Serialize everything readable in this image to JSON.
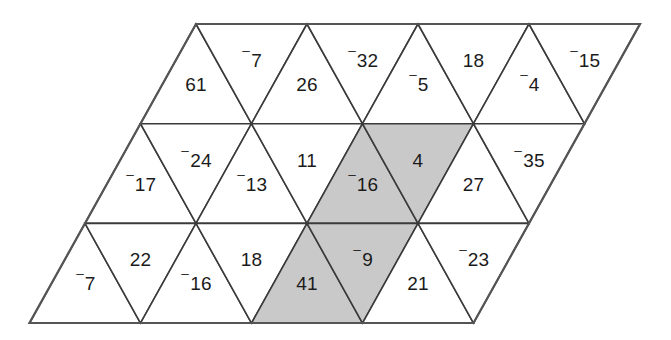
{
  "figure": {
    "name": "triangular-number-grid",
    "shape": "rhombus",
    "rows": 3,
    "cells_per_row": 9,
    "colors": {
      "background": "#ffffff",
      "cell_fill": "#ffffff",
      "shaded_fill": "#c9c9c9",
      "stroke": "#3a3a3a",
      "text": "#1b1b1b"
    },
    "negative_sign": "⁻"
  },
  "geometry": {
    "top_left_x": 196,
    "top_y": 24,
    "bottom_y": 323,
    "row_height": 99.7,
    "half_width": 55.5,
    "row_shift": -55.5
  },
  "chart_data": {
    "type": "table",
    "title": "",
    "rows": [
      {
        "row": 1,
        "cells": [
          {
            "index": 0,
            "orientation": "up",
            "value": "61",
            "sign": "",
            "magnitude": 61,
            "shaded": false
          },
          {
            "index": 1,
            "orientation": "down",
            "value": "⁻7",
            "sign": "⁻",
            "magnitude": 7,
            "shaded": false
          },
          {
            "index": 2,
            "orientation": "up",
            "value": "26",
            "sign": "",
            "magnitude": 26,
            "shaded": false
          },
          {
            "index": 3,
            "orientation": "down",
            "value": "⁻32",
            "sign": "⁻",
            "magnitude": 32,
            "shaded": false
          },
          {
            "index": 4,
            "orientation": "up",
            "value": "⁻5",
            "sign": "⁻",
            "magnitude": 5,
            "shaded": false
          },
          {
            "index": 5,
            "orientation": "down",
            "value": "18",
            "sign": "",
            "magnitude": 18,
            "shaded": false
          },
          {
            "index": 6,
            "orientation": "up",
            "value": "⁻4",
            "sign": "⁻",
            "magnitude": 4,
            "shaded": false
          },
          {
            "index": 7,
            "orientation": "down",
            "value": "⁻15",
            "sign": "⁻",
            "magnitude": 15,
            "shaded": false
          },
          {
            "index": 8,
            "orientation": "up",
            "value": "",
            "sign": "",
            "magnitude": null,
            "shaded": false
          }
        ]
      },
      {
        "row": 2,
        "cells": [
          {
            "index": 0,
            "orientation": "up",
            "value": "⁻17",
            "sign": "⁻",
            "magnitude": 17,
            "shaded": false
          },
          {
            "index": 1,
            "orientation": "down",
            "value": "⁻24",
            "sign": "⁻",
            "magnitude": 24,
            "shaded": false
          },
          {
            "index": 2,
            "orientation": "up",
            "value": "⁻13",
            "sign": "⁻",
            "magnitude": 13,
            "shaded": false
          },
          {
            "index": 3,
            "orientation": "down",
            "value": "11",
            "sign": "",
            "magnitude": 11,
            "shaded": false
          },
          {
            "index": 4,
            "orientation": "up",
            "value": "⁻16",
            "sign": "⁻",
            "magnitude": 16,
            "shaded": true
          },
          {
            "index": 5,
            "orientation": "down",
            "value": "4",
            "sign": "",
            "magnitude": 4,
            "shaded": true
          },
          {
            "index": 6,
            "orientation": "up",
            "value": "27",
            "sign": "",
            "magnitude": 27,
            "shaded": false
          },
          {
            "index": 7,
            "orientation": "down",
            "value": "⁻35",
            "sign": "⁻",
            "magnitude": 35,
            "shaded": false
          },
          {
            "index": 8,
            "orientation": "up",
            "value": "",
            "sign": "",
            "magnitude": null,
            "shaded": false
          }
        ]
      },
      {
        "row": 3,
        "cells": [
          {
            "index": 0,
            "orientation": "up",
            "value": "⁻7",
            "sign": "⁻",
            "magnitude": 7,
            "shaded": false
          },
          {
            "index": 1,
            "orientation": "down",
            "value": "22",
            "sign": "",
            "magnitude": 22,
            "shaded": false
          },
          {
            "index": 2,
            "orientation": "up",
            "value": "⁻16",
            "sign": "⁻",
            "magnitude": 16,
            "shaded": false
          },
          {
            "index": 3,
            "orientation": "down",
            "value": "18",
            "sign": "",
            "magnitude": 18,
            "shaded": false
          },
          {
            "index": 4,
            "orientation": "up",
            "value": "41",
            "sign": "",
            "magnitude": 41,
            "shaded": true
          },
          {
            "index": 5,
            "orientation": "down",
            "value": "⁻9",
            "sign": "⁻",
            "magnitude": 9,
            "shaded": true
          },
          {
            "index": 6,
            "orientation": "up",
            "value": "21",
            "sign": "",
            "magnitude": 21,
            "shaded": false
          },
          {
            "index": 7,
            "orientation": "down",
            "value": "⁻23",
            "sign": "⁻",
            "magnitude": 23,
            "shaded": false
          },
          {
            "index": 8,
            "orientation": "up",
            "value": "",
            "sign": "",
            "magnitude": null,
            "shaded": false
          }
        ]
      }
    ],
    "shaded_cells": [
      "r2c4",
      "r2c5",
      "r3c4",
      "r3c5"
    ],
    "shaded_values": [
      "⁻16",
      "4",
      "41",
      "⁻9"
    ]
  }
}
